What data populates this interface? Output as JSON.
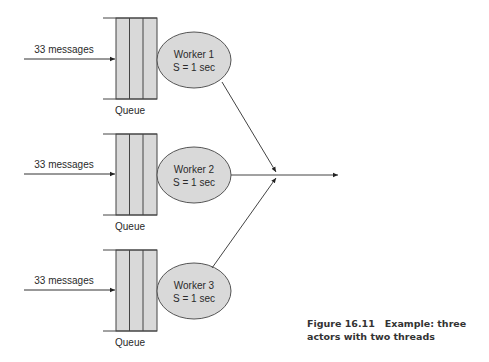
{
  "diagram": {
    "rows": [
      {
        "input_label": "33 messages",
        "queue_label": "Queue",
        "worker_name": "Worker 1",
        "worker_service": "S = 1 sec"
      },
      {
        "input_label": "33 messages",
        "queue_label": "Queue",
        "worker_name": "Worker 2",
        "worker_service": "S = 1 sec"
      },
      {
        "input_label": "33 messages",
        "queue_label": "Queue",
        "worker_name": "Worker 3",
        "worker_service": "S = 1 sec"
      }
    ],
    "colors": {
      "queue_fill": "#d9d9d9",
      "worker_fill": "#d9d9d9",
      "stroke": "#333333"
    }
  },
  "caption": {
    "figure_number": "Figure 16.11",
    "text": "Example: three actors with two threads"
  }
}
